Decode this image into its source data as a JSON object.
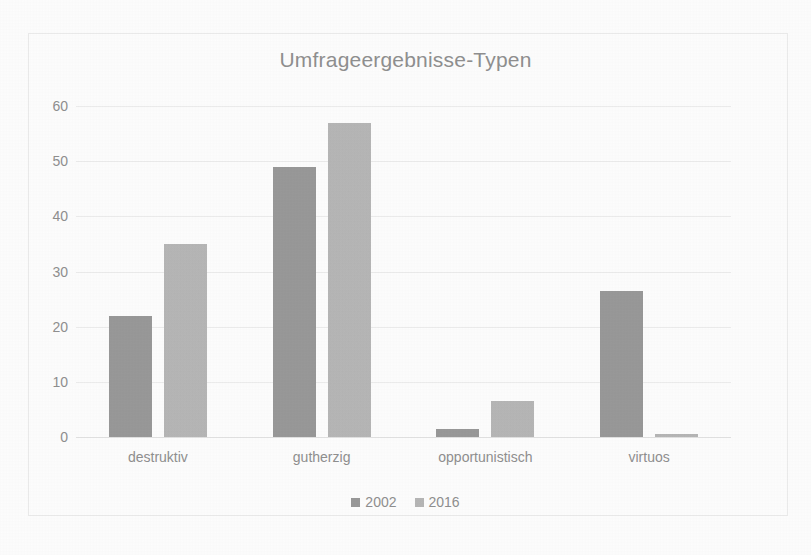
{
  "chart_data": {
    "type": "bar",
    "title": "Umfrageergebnisse-Typen",
    "xlabel": "",
    "ylabel": "",
    "categories": [
      "destruktiv",
      "gutherzig",
      "opportunistisch",
      "virtuos"
    ],
    "series": [
      {
        "name": "2002",
        "color": "#989898",
        "values": [
          22,
          49,
          1.5,
          26.5
        ]
      },
      {
        "name": "2016",
        "color": "#b6b6b6",
        "values": [
          35,
          57,
          6.5,
          0.5
        ]
      }
    ],
    "ylim": [
      0,
      60
    ],
    "yticks": [
      0,
      10,
      20,
      30,
      40,
      50,
      60
    ],
    "ytick_labels": [
      "0",
      "10",
      "20",
      "30",
      "40",
      "50",
      "60"
    ],
    "grid": true,
    "legend_position": "bottom"
  },
  "legend": {
    "entries": [
      {
        "label": "2002",
        "color": "#989898"
      },
      {
        "label": "2016",
        "color": "#b6b6b6"
      }
    ]
  },
  "style": {
    "text_color": "#8f8f8f",
    "gridline_color": "#ececec",
    "frame_color": "#ebebeb",
    "background": "#fdfdfd"
  }
}
